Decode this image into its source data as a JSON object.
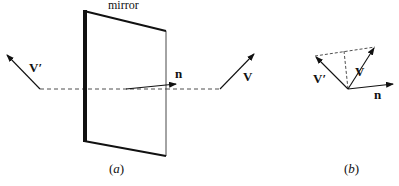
{
  "figure": {
    "panel_a": {
      "mirror_label": "mirror",
      "vector_incident_label": "V",
      "vector_reflected_label": "V′",
      "normal_label": "n",
      "caption_open": "(",
      "caption_letter": "a",
      "caption_close": ")"
    },
    "panel_b": {
      "vector_incident_label": "V",
      "vector_reflected_label": "V′",
      "normal_label": "n",
      "caption_open": "(",
      "caption_letter": "b",
      "caption_close": ")"
    }
  },
  "colors": {
    "ink": "#111111",
    "background": "#ffffff"
  }
}
